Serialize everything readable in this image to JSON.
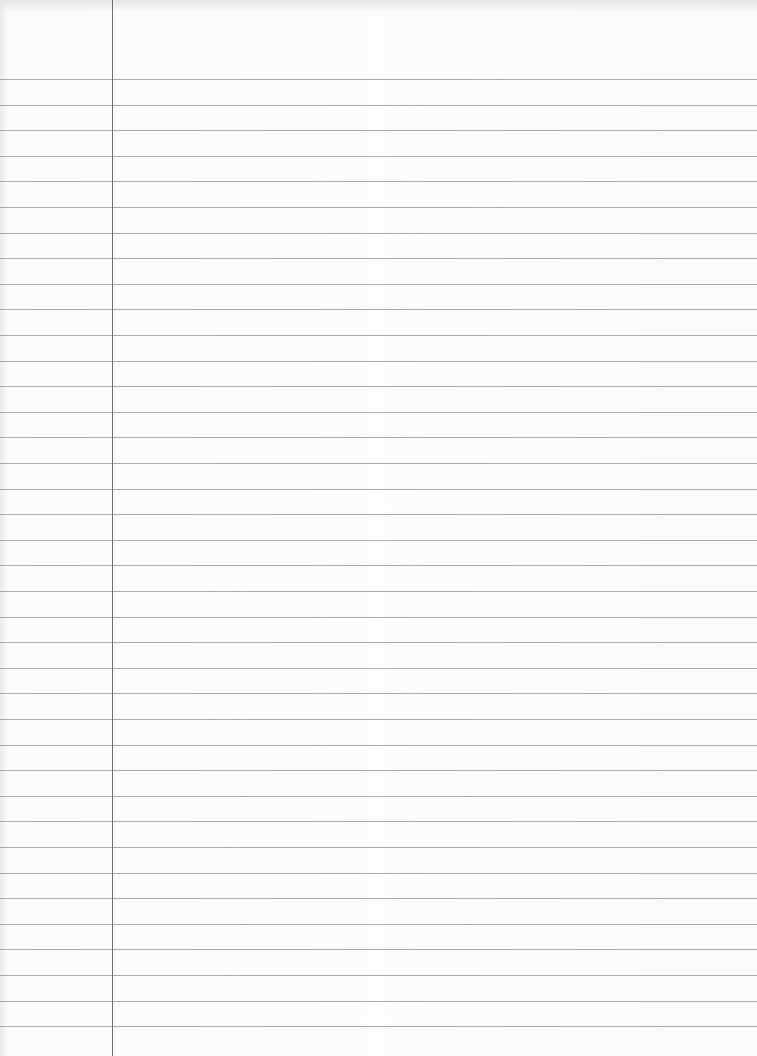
{
  "paper": {
    "kind": "ruled-notebook-paper",
    "first_rule_y": 79,
    "rule_spacing": 25.6,
    "rule_count": 38,
    "margin_line_x": 112,
    "rule_color": "#9a9a9a",
    "margin_color": "#6f6f6f",
    "background_color": "#fdfdfd"
  }
}
